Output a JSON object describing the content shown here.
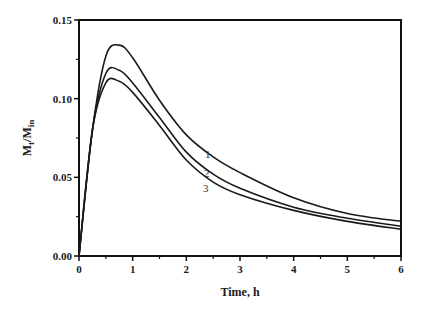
{
  "chart_data": {
    "type": "line",
    "title": "",
    "xlabel": "Time, h",
    "ylabel": "Mt/Min",
    "ylabel_main": "M",
    "ylabel_sub1": "t",
    "ylabel_mid": "/M",
    "ylabel_sub2": "in",
    "xlim": [
      0,
      6
    ],
    "ylim": [
      0,
      0.15
    ],
    "xticks": [
      "0",
      "1",
      "2",
      "3",
      "4",
      "5",
      "6"
    ],
    "yticks": [
      "0.00",
      "0.05",
      "0.10",
      "0.15"
    ],
    "grid": false,
    "legend": "inline labels on curves",
    "x": [
      0,
      0.25,
      0.5,
      0.75,
      1.0,
      1.5,
      2.0,
      2.5,
      3.0,
      4.0,
      5.0,
      6.0
    ],
    "series": [
      {
        "name": "1",
        "values": [
          0,
          0.08,
          0.127,
          0.134,
          0.126,
          0.099,
          0.077,
          0.063,
          0.053,
          0.037,
          0.027,
          0.022
        ]
      },
      {
        "name": "2",
        "values": [
          0,
          0.08,
          0.116,
          0.118,
          0.11,
          0.088,
          0.066,
          0.052,
          0.043,
          0.031,
          0.024,
          0.019
        ]
      },
      {
        "name": "3",
        "values": [
          0,
          0.08,
          0.11,
          0.111,
          0.104,
          0.083,
          0.061,
          0.047,
          0.039,
          0.029,
          0.022,
          0.017
        ]
      }
    ],
    "annotations": [
      {
        "text": "1",
        "x": 2.4,
        "y": 0.065
      },
      {
        "text": "2",
        "x": 2.38,
        "y": 0.053
      },
      {
        "text": "3",
        "x": 2.36,
        "y": 0.043
      }
    ]
  }
}
